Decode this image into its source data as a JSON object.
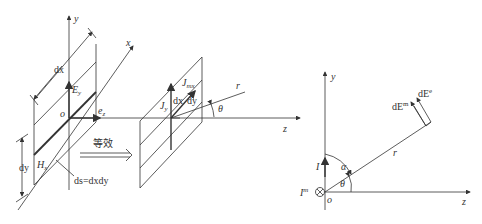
{
  "left_figure": {
    "axes": {
      "y": "y",
      "x": "x",
      "z": "z",
      "origin": "o"
    },
    "labels": {
      "dx": "dx",
      "dy": "dy",
      "Ey": "E",
      "Ey_sub": "y",
      "Hx": "H",
      "Hx_sub": "x",
      "ez": "e",
      "ez_sub": "z",
      "ds": "ds=dxdy",
      "equivalent": "等效",
      "Jy": "J",
      "Jy_sub": "y",
      "Jmx": "J",
      "Jmx_sub": "mx",
      "dx2": "dx",
      "dy2": "dy",
      "r": "r",
      "theta": "θ"
    }
  },
  "right_figure": {
    "axes": {
      "y": "y",
      "z": "z",
      "origin": "o"
    },
    "labels": {
      "I": "I",
      "Im": "I",
      "Im_sup": "m",
      "alpha": "α",
      "theta": "θ",
      "r": "r",
      "dEm": "dE",
      "dEm_sup": "m",
      "dEe": "dE",
      "dEe_sup": "e"
    }
  },
  "colors": {
    "line": "#333333",
    "background": "#ffffff"
  }
}
